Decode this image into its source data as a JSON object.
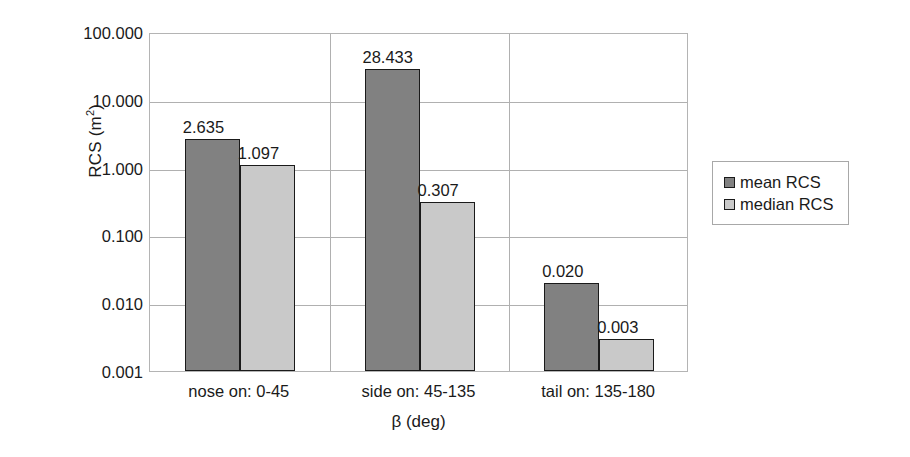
{
  "chart_data": {
    "type": "bar",
    "title": "",
    "xlabel": "β (deg)",
    "ylabel": "RCS (m²)",
    "yscale": "log",
    "ylim": [
      0.001,
      100
    ],
    "ytick_labels": [
      "100.000",
      "10.000",
      "1.000",
      "0.100",
      "0.010",
      "0.001"
    ],
    "ytick_values": [
      100,
      10,
      1,
      0.1,
      0.01,
      0.001
    ],
    "grid": "horizontal-and-category-separators",
    "legend_position": "right",
    "categories": [
      "nose on:  0-45",
      "side on: 45-135",
      "tail on: 135-180"
    ],
    "series": [
      {
        "name": "mean RCS",
        "color": "#818181",
        "values": [
          2.635,
          28.433,
          0.02
        ],
        "labels": [
          "2.635",
          "28.433",
          "0.020"
        ]
      },
      {
        "name": "median RCS",
        "color": "#c9c9c9",
        "values": [
          1.097,
          0.307,
          0.003
        ],
        "labels": [
          "1.097",
          "0.307",
          "0.003"
        ]
      }
    ]
  },
  "axes": {
    "y_title_main": "RCS (m",
    "y_title_sup": "2",
    "y_title_close": ")",
    "x_title": "β (deg)"
  },
  "legend": {
    "items": [
      {
        "label": "mean RCS",
        "color": "#818181"
      },
      {
        "label": "median RCS",
        "color": "#c9c9c9"
      }
    ]
  }
}
